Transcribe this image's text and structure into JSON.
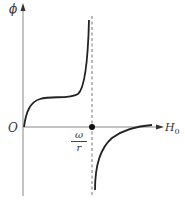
{
  "diagram": {
    "y_axis_label": "ϕ",
    "x_axis_label_main": "H",
    "x_axis_label_sub": "0",
    "origin_label": "O",
    "marker_fraction": {
      "numerator": "ω",
      "denominator": "r"
    },
    "colors": {
      "axis": "#888888",
      "curve": "#222222",
      "asymptote": "#777777",
      "marker": "#111111"
    }
  }
}
